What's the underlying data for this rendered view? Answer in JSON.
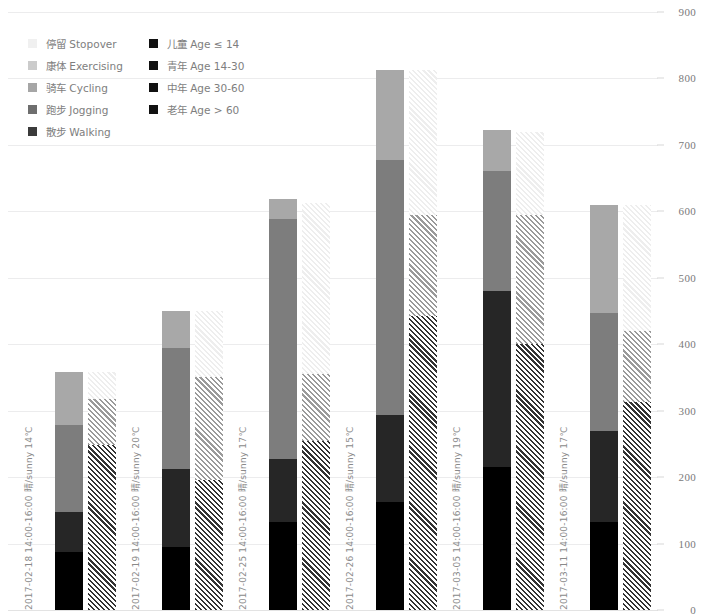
{
  "chart_data": {
    "type": "bar",
    "title": "",
    "subtitle": "",
    "xlabel": "",
    "ylabel": "",
    "ylim": [
      0,
      900
    ],
    "yticks": [
      0,
      100,
      200,
      300,
      400,
      500,
      600,
      700,
      800,
      900
    ],
    "grid": true,
    "legend_position": "top-left",
    "stacked": true,
    "categories": [
      "2017-02-18 14:00-16:00 晴/sunny 14℃",
      "2017-02-19 14:00-16:00 晴/sunny 20℃",
      "2017-02-25 14:00-16:00 晴/sunny 17℃",
      "2017-02-26 14:00-16:00 晴/sunny 15℃",
      "2017-03-05 14:00-16:00 晴/sunny 19℃",
      "2017-03-11 14:00-16:00 晴/sunny 17℃"
    ],
    "series_groups": [
      {
        "name": "age",
        "note": "left bar of each pair — solid fills",
        "series": [
          {
            "name": "老年 Age > 60",
            "color": "#000000",
            "values": [
              88,
              95,
              133,
              163,
              215,
              132
            ]
          },
          {
            "name": "中年 Age 30-60",
            "color": "#262626",
            "values": [
              60,
              117,
              95,
              130,
              265,
              137
            ]
          },
          {
            "name": "青年 Age 14-30",
            "color": "#7d7d7d",
            "values": [
              130,
              183,
              360,
              385,
              180,
              178
            ]
          },
          {
            "name": "儿童 Age ≤ 14",
            "color": "#a8a8a8",
            "values": [
              80,
              55,
              30,
              135,
              62,
              163
            ]
          }
        ]
      },
      {
        "name": "activity",
        "note": "right bar of each pair — hatched fills",
        "series": [
          {
            "name": "散步 Walking",
            "color": "#333333",
            "values": [
              248,
              196,
              255,
              443,
              400,
              313
            ]
          },
          {
            "name": "跑步 Jogging",
            "color": "#5c5c5c",
            "values": [
              0,
              0,
              0,
              0,
              0,
              0
            ]
          },
          {
            "name": "骑车 Cycling",
            "color": "#9a9a9a",
            "values": [
              70,
              154,
              100,
              152,
              195,
              107
            ]
          },
          {
            "name": "康体 Exercising",
            "color": "#c9c9c9",
            "values": [
              0,
              0,
              0,
              0,
              0,
              0
            ]
          },
          {
            "name": "停留 Stopover",
            "color": "#eeeeee",
            "values": [
              40,
              100,
              258,
              218,
              125,
              190
            ]
          }
        ]
      }
    ],
    "totals_left": [
      358,
      450,
      618,
      813,
      722,
      610
    ],
    "totals_right": [
      358,
      450,
      613,
      813,
      720,
      610
    ]
  },
  "legend": {
    "left_column": [
      {
        "label": "停留 Stopover",
        "swatch": "legend-swatch-stopover",
        "color": "#f0f0f0"
      },
      {
        "label": "康体 Exercising",
        "swatch": "legend-swatch-exercising",
        "color": "#cbcbcb"
      },
      {
        "label": "骑车 Cycling",
        "swatch": "legend-swatch-cycling",
        "color": "#a6a6a6"
      },
      {
        "label": "跑步 Jogging",
        "swatch": "legend-swatch-jogging",
        "color": "#6e6e6e"
      },
      {
        "label": "散步 Walking",
        "swatch": "legend-swatch-walking",
        "color": "#3b3b3b"
      }
    ],
    "right_column": [
      {
        "label": "儿童 Age ≤ 14",
        "swatch": "legend-swatch-age-child",
        "color": "#111111"
      },
      {
        "label": "青年 Age 14-30",
        "swatch": "legend-swatch-age-youth",
        "color": "#111111"
      },
      {
        "label": "中年 Age 30-60",
        "swatch": "legend-swatch-age-middle",
        "color": "#111111"
      },
      {
        "label": "老年 Age > 60",
        "swatch": "legend-swatch-age-senior",
        "color": "#111111"
      }
    ]
  },
  "axis": {
    "ticks": [
      "900",
      "800",
      "700",
      "600",
      "500",
      "400",
      "300",
      "200",
      "100",
      "0"
    ]
  }
}
